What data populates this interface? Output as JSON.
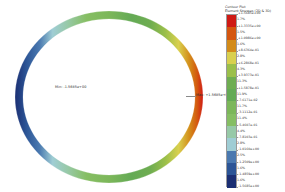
{
  "view": {
    "background": "#ffffff",
    "type": "fea-contour-plot",
    "model_shape": "ring"
  },
  "model": {
    "name": "circular-ring-contour",
    "annotations": {
      "min": {
        "label": "Min: -1.5685e+00",
        "color": "#1c2d73"
      },
      "max": {
        "label": "Max: +1.5685e+00",
        "color": "#c41a12"
      }
    }
  },
  "legend": {
    "title_line1": "Contour Plot",
    "title_line2": "Element Stresses (2D & 3D)",
    "bands": [
      {
        "color": "#cf1a14",
        "upper_label": "+1.5685e+00",
        "percent": "1.7%"
      },
      {
        "color": "#d4560f",
        "upper_label": "+1.3335e+00",
        "percent": "1.5%"
      },
      {
        "color": "#d38b19",
        "upper_label": "+1.0986e+00",
        "percent": "1.6%"
      },
      {
        "color": "#d9d04e",
        "upper_label": "+8.6364e-01",
        "percent": "2.8%"
      },
      {
        "color": "#9bbf4a",
        "upper_label": "+6.2868e-01",
        "percent": "4.3%"
      },
      {
        "color": "#6fad51",
        "upper_label": "+3.9373e-01",
        "percent": "11.3%"
      },
      {
        "color": "#64aa55",
        "upper_label": "+1.5878e-01",
        "percent": "11.9%"
      },
      {
        "color": "#7cb75a",
        "upper_label": "-7.6171e-02",
        "percent": "11.7%"
      },
      {
        "color": "#86be63",
        "upper_label": "-3.1112e-01",
        "percent": "11.4%"
      },
      {
        "color": "#97c9a7",
        "upper_label": "-5.4607e-01",
        "percent": "4.4%"
      },
      {
        "color": "#9fcdd4",
        "upper_label": "-7.8103e-01",
        "percent": "2.8%"
      },
      {
        "color": "#4a79b0",
        "upper_label": "-1.0160e+00",
        "percent": "2.5%"
      },
      {
        "color": "#2c5596",
        "upper_label": "-1.2509e+00",
        "percent": "1.6%"
      },
      {
        "color": "#1b2f73",
        "upper_label": "-1.4859e+00",
        "percent": "1.6%"
      }
    ],
    "bottom_label": "-1.5685e+00"
  },
  "chart_data": {
    "type": "heatmap",
    "title": "Contour Plot",
    "subtitle": "Element Stresses (2D & 3D)",
    "colormap": "jet-discrete",
    "vmin": -1.5685,
    "vmax": 1.5685,
    "units": "",
    "levels": [
      1.5685,
      1.3335,
      1.0986,
      0.86364,
      0.62868,
      0.39373,
      0.15878,
      -0.076171,
      -0.31112,
      -0.54607,
      -0.78103,
      -1.016,
      -1.2509,
      -1.4859,
      -1.5685
    ],
    "level_labels": [
      "+1.5685e+00",
      "+1.3335e+00",
      "+1.0986e+00",
      "+8.6364e-01",
      "+6.2868e-01",
      "+3.9373e-01",
      "+1.5878e-01",
      "-7.6171e-02",
      "-3.1112e-01",
      "-5.4607e-01",
      "-7.8103e-01",
      "-1.0160e+00",
      "-1.2509e+00",
      "-1.4859e+00",
      "-1.5685e+00"
    ],
    "band_percents": [
      1.7,
      1.5,
      1.6,
      2.8,
      4.3,
      11.3,
      11.9,
      11.7,
      11.4,
      4.4,
      2.8,
      2.5,
      1.6,
      1.6
    ],
    "band_colors": [
      "#cf1a14",
      "#d4560f",
      "#d38b19",
      "#d9d04e",
      "#9bbf4a",
      "#6fad51",
      "#64aa55",
      "#7cb75a",
      "#86be63",
      "#97c9a7",
      "#9fcdd4",
      "#4a79b0",
      "#2c5596",
      "#1b2f73"
    ],
    "geometry": "annular ring, value varies ~cos(theta): maximum at right (theta=0), minimum at left (theta=180deg), mid-range green at top and bottom",
    "min_annotation": "Min: -1.5685e+00",
    "max_annotation": "Max: +1.5685e+00",
    "xlabel": "",
    "ylabel": "",
    "grid": false,
    "legend_position": "right"
  }
}
